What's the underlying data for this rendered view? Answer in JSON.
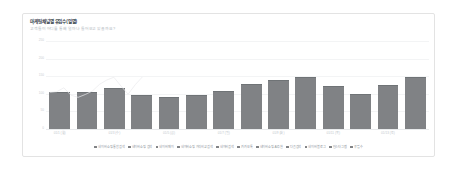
{
  "card": {
    "title": "마케팅채널별 유입수(일별)",
    "subtitle": "고객들이 어디를 통해 얼마나 들어오고 있을까요?"
  },
  "chart_data": {
    "type": "bar",
    "title": "마케팅채널별 유입수(일별)",
    "subtitle": "고객들이 어디를 통해 얼마나 들어오고 있을까요?",
    "xlabel": "",
    "ylabel": "",
    "grid": true,
    "legend_position": "bottom",
    "ylim": [
      0,
      250
    ],
    "ytick_labels": [
      "250",
      "200",
      "150",
      "100",
      "50",
      "0"
    ],
    "ytick_values": [
      250,
      200,
      150,
      100,
      50,
      0
    ],
    "categories": [
      "01/1 (월)",
      "01/2 (화)",
      "01/3 (수)",
      "01/4 (목)",
      "01/5 (금)",
      "01/6 (토)",
      "01/7 (일)",
      "01/8 (월)",
      "01/9 (화)",
      "01/10 (수)",
      "01/11 (목)",
      "01/12 (금)",
      "01/13 (토)",
      "01/14 (일)"
    ],
    "xtick_labels_shown": [
      "01/1 (월)",
      "",
      "01/3 (수)",
      "",
      "01/5 (금)",
      "",
      "01/7 (일)",
      "",
      "01/9 (화)",
      "",
      "01/11 (목)",
      "",
      "01/13 (토)",
      ""
    ],
    "values": [
      104,
      106,
      117,
      96,
      90,
      98,
      108,
      127,
      139,
      147,
      122,
      99,
      126,
      148
    ],
    "series": [
      {
        "name": "총 유입수",
        "values": [
          104,
          106,
          117,
          96,
          90,
          98,
          108,
          127,
          139,
          147,
          122,
          99,
          126,
          148
        ]
      }
    ],
    "legend": [
      "네이버쇼핑 통합검색",
      "네이버쇼핑 검색",
      "네이버페이",
      "네이버쇼핑 가격비교검색",
      "네이버검색",
      "카카오톡",
      "네이버쇼핑 AI추천",
      "다음검색",
      "네이버블로그",
      "인스타그램",
      "유입수"
    ]
  }
}
